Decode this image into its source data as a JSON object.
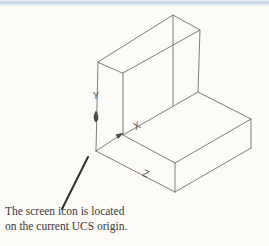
{
  "page": {
    "background_color": "#fcfbf7",
    "top_band_color": "#c2d1e2",
    "wireframe_color": "#6f6f6f",
    "leader_color": "#2f2f2f",
    "text_color": "#3a3a3a"
  },
  "diagram": {
    "ucs": {
      "y_label": "Y",
      "x_label": "X",
      "z_label": "Z"
    },
    "callout": {
      "line1": "The screen icon is located",
      "line2": "on the current UCS origin."
    }
  }
}
